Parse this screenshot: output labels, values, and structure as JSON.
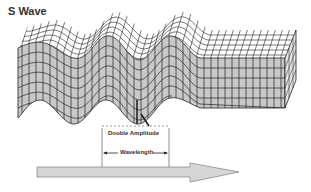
{
  "diagram": {
    "title": "S Wave",
    "labels": {
      "double_amplitude": "Double Amplitude",
      "wavelength": "Wavelength"
    },
    "colors": {
      "front_face": "#c8c8c8",
      "top_face": "#ffffff",
      "grid_line": "#222222",
      "arrow_fill": "#d6d6d6",
      "arrow_stroke": "#8a8a8a",
      "text": "#333333"
    },
    "elements": [
      "wavy-grid-block",
      "undisturbed-grid-block",
      "double-amplitude-marker",
      "wavelength-marker",
      "propagation-direction-arrow"
    ]
  }
}
